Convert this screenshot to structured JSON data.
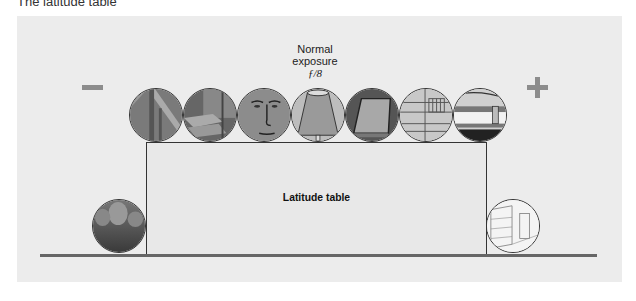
{
  "caption": "The latitude table",
  "diagram": {
    "minus_sign": "−",
    "plus_sign": "+",
    "normal_exposure": {
      "line1": "Normal",
      "line2": "exposure",
      "fstop": "ƒ/8"
    },
    "table_label": "Latitude table",
    "top_row_subjects": [
      "window-frame-icon",
      "open-book-icon",
      "face-icon",
      "lampshade-icon",
      "closed-book-icon",
      "building-facade-icon",
      "curtain-rod-icon"
    ],
    "bottom_left_subject": "dark-rocks-icon",
    "bottom_right_subject": "bright-street-icon",
    "colors": {
      "panel": "#ececec",
      "sign": "#8c8c8c",
      "outline": "#333333",
      "ground": "#666666"
    }
  }
}
